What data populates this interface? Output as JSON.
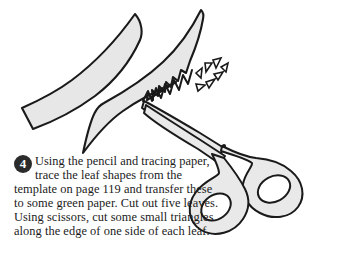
{
  "page": {
    "type": "craft-instruction-illustration",
    "background_color": "#ffffff",
    "width": 337,
    "height": 274
  },
  "step": {
    "number": "4",
    "badge_shape": "filled-circle",
    "badge_background": "#2b2b2b",
    "badge_text_color": "#ffffff",
    "body_text": "Using the pencil and tracing paper, trace the leaf shapes from the template on page 119 and transfer these to some green paper. Cut out five leaves. Using scissors, cut some small triangles along the edge of one side of each leaf.",
    "lines": [
      "Using the pencil and tracing",
      "paper, trace the leaf shapes",
      "from the template on page 119 and",
      "transfer these to some green paper.",
      "Cut out five leaves. Using scissors,",
      "cut some small triangles along the",
      "edge of one side of each leaf."
    ],
    "text_color": "#1b1b1b"
  },
  "illustration": {
    "title": "leaf-shapes-and-scissors",
    "line_color": "#1a1a1a",
    "fill_color": "#e7e7e7",
    "fill_color_alt": "#ededed",
    "objects": [
      {
        "name": "leaf-upper-left",
        "description": "Curved pointed leaf shape with plain edges, tip pointing upper right"
      },
      {
        "name": "leaf-lower-right",
        "description": "Curved pointed leaf shape with zigzag sawtooth cut along its upper edge"
      },
      {
        "name": "zigzag-cut-edge",
        "description": "Sawtooth triangular notches cut along one side of the leaf",
        "teeth_count": 7
      },
      {
        "name": "triangle-cuttings",
        "description": "Small scrap triangles scattered where cuts were made",
        "count": 6
      },
      {
        "name": "scissors",
        "description": "Open scissors pointing up-left with two oval finger loops and a pivot screw",
        "pivot": "screw-dot"
      }
    ]
  }
}
